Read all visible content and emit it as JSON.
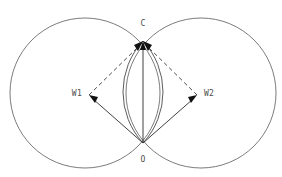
{
  "figure": {
    "title": "",
    "background_color": "#ffffff",
    "width": 282,
    "height": 177
  },
  "labels": {
    "apex": "C",
    "origin": "O",
    "left_center": "W1",
    "right_center": "W2"
  },
  "colors": {
    "circle_stroke": "#595959",
    "lens_stroke": "#4a4a4a",
    "solid_vector": "#2b2b2b",
    "dashed_vector": "#3a3a3a",
    "arrow_fill": "#111111",
    "label_text": "#4d4d4d"
  },
  "geometry": {
    "left_circle": {
      "cx": 85,
      "cy": 93,
      "r": 75
    },
    "right_circle": {
      "cx": 201,
      "cy": 93,
      "r": 75
    },
    "apex_point": {
      "x": 143,
      "y": 41
    },
    "origin_point": {
      "x": 143,
      "y": 143
    },
    "left_center_point": {
      "x": 89,
      "y": 95
    },
    "right_center_point": {
      "x": 197,
      "y": 95
    },
    "lens_left_bulge_x": 126,
    "lens_right_bulge_x": 160
  },
  "vectors": [
    {
      "name": "O-to-C",
      "from": "O",
      "to": "C",
      "style": "solid",
      "arrow_at": "C"
    },
    {
      "name": "O-to-W1",
      "from": "O",
      "to": "W1",
      "style": "solid",
      "arrow_at": "W1"
    },
    {
      "name": "O-to-W2",
      "from": "O",
      "to": "W2",
      "style": "solid",
      "arrow_at": "W2"
    },
    {
      "name": "W1-to-C",
      "from": "W1",
      "to": "C",
      "style": "dashed",
      "arrow_at": "C"
    },
    {
      "name": "W2-to-C",
      "from": "W2",
      "to": "C",
      "style": "dashed",
      "arrow_at": "C"
    }
  ]
}
